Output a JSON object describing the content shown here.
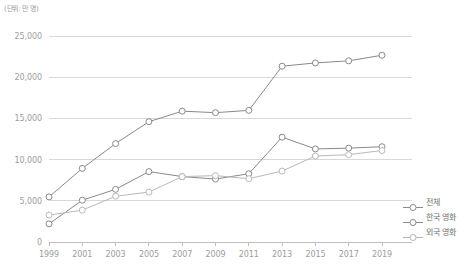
{
  "unit_note": "(단위: 만 명)",
  "legend": {
    "position": "right-bottom",
    "items": [
      {
        "label": "전체",
        "color": "#8a8a8a",
        "icon": "open-circle-marker"
      },
      {
        "label": "한국 영화",
        "color": "#8a8a8a",
        "icon": "open-circle-marker"
      },
      {
        "label": "외국 영화",
        "color": "#b4b4b4",
        "icon": "open-circle-marker"
      }
    ]
  },
  "axis": {
    "y_ticks": [
      "0",
      "5,000",
      "10,000",
      "15,000",
      "20,000",
      "25,000"
    ],
    "x_ticks": [
      "1999",
      "2001",
      "2003",
      "2005",
      "2007",
      "2009",
      "2011",
      "2013",
      "2015",
      "2017",
      "2019"
    ]
  },
  "colors": {
    "grid": "#d8d8d8",
    "axis": "#bdbdbd",
    "series_total": "#8a8a8a",
    "series_korean": "#8a8a8a",
    "series_foreign": "#b9b9b9",
    "tick_text": "#9d9d9d",
    "unit_text": "#9a9a9a",
    "background": "#ffffff"
  },
  "chart_data": {
    "type": "line",
    "title": "",
    "subtitle": "",
    "xlabel": "",
    "ylabel": "",
    "unit": "만 명",
    "grid": true,
    "legend_position": "right",
    "ylim": [
      0,
      25000
    ],
    "ytick_values": [
      0,
      5000,
      10000,
      15000,
      20000,
      25000
    ],
    "categories": [
      "1999",
      "2001",
      "2003",
      "2005",
      "2007",
      "2009",
      "2011",
      "2013",
      "2015",
      "2017",
      "2019"
    ],
    "series": [
      {
        "name": "전체",
        "color": "#8a8a8a",
        "values": [
          5470,
          8936,
          11947,
          14600,
          15877,
          15697,
          15972,
          21335,
          21729,
          21987,
          22668
        ]
      },
      {
        "name": "한국 영화",
        "color": "#8a8a8a",
        "values": [
          2200,
          5072,
          6391,
          8544,
          7939,
          7641,
          8287,
          12729,
          11293,
          11390,
          11562
        ]
      },
      {
        "name": "외국 영화",
        "color": "#b9b9b9",
        "values": [
          3270,
          3864,
          5556,
          6056,
          7938,
          8056,
          7685,
          8606,
          10436,
          10597,
          11106
        ]
      }
    ]
  }
}
